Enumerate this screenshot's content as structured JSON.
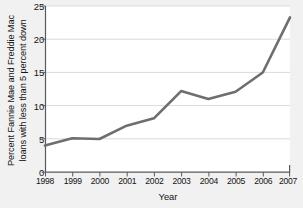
{
  "chart_data": {
    "type": "line",
    "title": "",
    "xlabel": "Year",
    "ylabel_lines": [
      "Percent Fannie Mae and Freddie Mac",
      "loans with less than 5 percent down"
    ],
    "ylabel": "Percent Fannie Mae and Freddie Mac loans with less than 5 percent down",
    "categories": [
      "1998",
      "1999",
      "2000",
      "2001",
      "2002",
      "2003",
      "2004",
      "2005",
      "2006",
      "2007"
    ],
    "x": [
      1998,
      1999,
      2000,
      2001,
      2002,
      2003,
      2004,
      2005,
      2006,
      2007
    ],
    "values": [
      4.0,
      5.1,
      5.0,
      7.0,
      8.1,
      12.2,
      11.0,
      12.1,
      15.0,
      23.3
    ],
    "series": [
      {
        "name": "Percent Fannie Mae and Freddie Mac loans with less than 5 percent down",
        "values": [
          4.0,
          5.1,
          5.0,
          7.0,
          8.1,
          12.2,
          11.0,
          12.1,
          15.0,
          23.3
        ]
      }
    ],
    "ylim": [
      0,
      25
    ],
    "xlim": [
      1998,
      2007
    ],
    "yticks": [
      0,
      5,
      10,
      15,
      20,
      25
    ],
    "ytick_labels": [
      "0",
      "5",
      "10",
      "15",
      "20",
      "25"
    ],
    "xticks": [
      1998,
      1999,
      2000,
      2001,
      2002,
      2003,
      2004,
      2005,
      2006,
      2007
    ],
    "xtick_labels": [
      "1998",
      "1999",
      "2000",
      "2001",
      "2002",
      "2003",
      "2004",
      "2005",
      "2006",
      "2007"
    ],
    "grid": "horizontal",
    "legend": "none",
    "colors": {
      "line": "#6e6e6e",
      "grid": "#d8d8d8",
      "axis": "#5a5a5a",
      "plot_background": "#ffffff",
      "page_background": "#f1f1f1",
      "text": "#141414"
    }
  }
}
